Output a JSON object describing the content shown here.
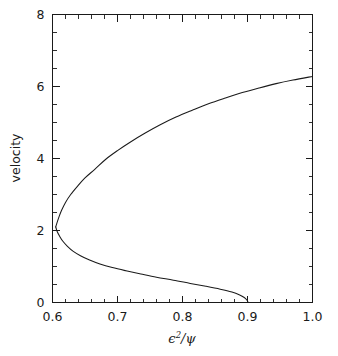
{
  "figure": {
    "title": "",
    "background_color": "#ffffff",
    "line_color": "#1a1a1a"
  },
  "axes": {
    "x": {
      "label": "/",
      "label_symbol_numerator": "ϵ",
      "label_exponent": "2",
      "label_denominator": "ψ",
      "ticks": [
        "0.6",
        "0.7",
        "0.8",
        "0.9",
        "1.0"
      ]
    },
    "y": {
      "label": "velocity",
      "ticks": [
        "0",
        "2",
        "4",
        "6",
        "8"
      ]
    }
  },
  "chart_data": {
    "type": "line",
    "title": "",
    "xlabel": "ϵ²/ψ",
    "ylabel": "velocity",
    "xlim": [
      0.6,
      1.0
    ],
    "ylim": [
      0,
      8
    ],
    "xticks": [
      0.6,
      0.7,
      0.8,
      0.9,
      1.0
    ],
    "yticks": [
      0,
      2,
      4,
      6,
      8
    ],
    "xtick_labels": [
      "0.6",
      "0.7",
      "0.8",
      "0.9",
      "1.0"
    ],
    "ytick_labels": [
      "0",
      "2",
      "4",
      "6",
      "8"
    ],
    "x_minor_step": 0.02,
    "y_minor_step": 0.5,
    "grid": false,
    "legend": null,
    "tick_direction": "in",
    "frame": "full-box",
    "series": [
      {
        "name": "upper-branch",
        "comment": "rising branch from the turning point to the right edge",
        "x": [
          0.605,
          0.607,
          0.61,
          0.614,
          0.62,
          0.628,
          0.638,
          0.65,
          0.665,
          0.682,
          0.7,
          0.72,
          0.742,
          0.765,
          0.79,
          0.815,
          0.84,
          0.866,
          0.892,
          0.918,
          0.944,
          0.97,
          1.0
        ],
        "y": [
          2.1,
          2.22,
          2.38,
          2.56,
          2.78,
          3.0,
          3.22,
          3.46,
          3.7,
          3.98,
          4.22,
          4.46,
          4.7,
          4.93,
          5.15,
          5.34,
          5.52,
          5.68,
          5.83,
          5.96,
          6.08,
          6.18,
          6.28
        ]
      },
      {
        "name": "lower-branch",
        "comment": "descending branch from the turning point to the x-axis",
        "x": [
          0.605,
          0.607,
          0.611,
          0.616,
          0.623,
          0.632,
          0.643,
          0.657,
          0.673,
          0.692,
          0.713,
          0.736,
          0.76,
          0.786,
          0.812,
          0.836,
          0.858,
          0.876,
          0.888,
          0.895,
          0.899,
          0.901
        ],
        "y": [
          2.1,
          1.98,
          1.84,
          1.7,
          1.56,
          1.42,
          1.3,
          1.18,
          1.07,
          0.97,
          0.88,
          0.79,
          0.7,
          0.62,
          0.53,
          0.45,
          0.37,
          0.29,
          0.21,
          0.14,
          0.07,
          0.0
        ]
      }
    ],
    "annotations": [
      {
        "name": "turning-point",
        "x": 0.605,
        "y": 2.1
      },
      {
        "name": "upper-right-endpoint",
        "x": 1.0,
        "y": 6.28
      },
      {
        "name": "lower-endpoint",
        "x": 0.901,
        "y": 0.0
      }
    ]
  }
}
